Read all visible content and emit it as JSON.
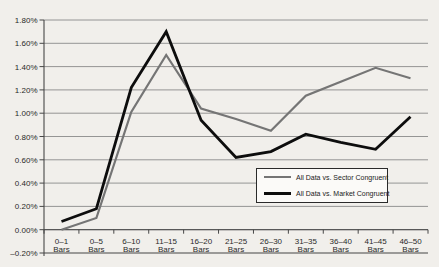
{
  "figure": {
    "background": "#f1efeb",
    "text_color": "#2a2a2a",
    "grid_color": "#8a8a8a",
    "axis_color": "#474747",
    "legend_background": "#fbfaf8",
    "legend_border": "#2a2a2a"
  },
  "chart_data": {
    "type": "line",
    "title": "",
    "value_unit": "%",
    "x_categories": [
      "0–1",
      "0–5",
      "6–10",
      "11–15",
      "16–20",
      "21–25",
      "26–30",
      "31–35",
      "36–40",
      "41–45",
      "46–50"
    ],
    "x_category_unit": "Bars",
    "ylim": [
      -0.2,
      1.8
    ],
    "ytick_step": 0.2,
    "ytick_labels": [
      "1.80%",
      "1.60%",
      "1.40%",
      "1.20%",
      "1.00%",
      "0.80%",
      "0.60%",
      "0.40%",
      "0.20%",
      "0.00%",
      "–0.20%"
    ],
    "grid": true,
    "legend_position": "inside-bottom-center",
    "series": [
      {
        "name": "All Data vs. Sector Congruent",
        "color": "#757575",
        "stroke_width": 2.2,
        "values": [
          0.0,
          0.1,
          1.01,
          1.5,
          1.04,
          0.95,
          0.85,
          1.15,
          1.27,
          1.39,
          1.3
        ]
      },
      {
        "name": "All Data vs. Market Congruent",
        "color": "#0d0d0d",
        "stroke_width": 2.8,
        "values": [
          0.07,
          0.18,
          1.22,
          1.7,
          0.94,
          0.62,
          0.67,
          0.82,
          0.75,
          0.69,
          0.97
        ]
      }
    ]
  }
}
